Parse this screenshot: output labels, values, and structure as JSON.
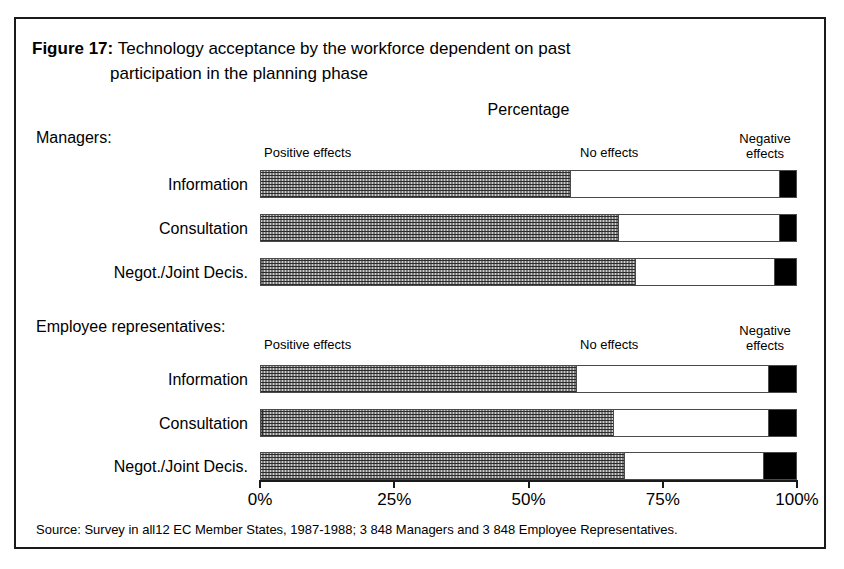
{
  "figure": {
    "number_label": "Figure 17:",
    "title_line_1": "Technology acceptance by the workforce dependent on past",
    "title_line_2": "participation in the planning phase",
    "axis_caption": "Percentage",
    "source": "Source: Survey in all12 EC Member States, 1987-1988; 3 848 Managers and 3 848 Employee Representatives."
  },
  "legend": {
    "positive": "Positive effects",
    "no_effects": "No effects",
    "negative_line_1": "Negative",
    "negative_line_2": "effects"
  },
  "groups": [
    {
      "title": "Managers:"
    },
    {
      "title": "Employee representatives:"
    }
  ],
  "axis": {
    "ticks": [
      "0%",
      "25%",
      "50%",
      "75%",
      "100%"
    ]
  },
  "rows": {
    "managers": [
      {
        "label": "Information"
      },
      {
        "label": "Consultation"
      },
      {
        "label": "Negot./Joint Decis."
      }
    ],
    "employees": [
      {
        "label": "Information"
      },
      {
        "label": "Consultation"
      },
      {
        "label": "Negot./Joint Decis."
      }
    ]
  },
  "colors": {
    "positive": "#cfcfcf",
    "no_effects": "#ffffff",
    "negative": "#000000",
    "frame": "#1a1a1a"
  },
  "chart_data": {
    "type": "bar",
    "orientation": "horizontal",
    "stacked": true,
    "title": "Technology acceptance by the workforce dependent on past participation in the planning phase",
    "xlabel": "Percentage",
    "ylabel": "",
    "xlim": [
      0,
      100
    ],
    "xticks": [
      0,
      25,
      50,
      75,
      100
    ],
    "xtick_labels": [
      "0%",
      "25%",
      "50%",
      "75%",
      "100%"
    ],
    "grid": false,
    "legend_position": "top",
    "series": [
      {
        "name": "Positive effects",
        "color": "#cfcfcf"
      },
      {
        "name": "No effects",
        "color": "#ffffff"
      },
      {
        "name": "Negative effects",
        "color": "#000000"
      }
    ],
    "panels": [
      {
        "group": "Managers:",
        "categories": [
          "Information",
          "Consultation",
          "Negot./Joint Decis."
        ],
        "values": [
          {
            "category": "Information",
            "positive": 58,
            "no_effects": 39,
            "negative": 3
          },
          {
            "category": "Consultation",
            "positive": 67,
            "no_effects": 30,
            "negative": 3
          },
          {
            "category": "Negot./Joint Decis.",
            "positive": 70,
            "no_effects": 26,
            "negative": 4
          }
        ]
      },
      {
        "group": "Employee representatives:",
        "categories": [
          "Information",
          "Consultation",
          "Negot./Joint Decis."
        ],
        "values": [
          {
            "category": "Information",
            "positive": 59,
            "no_effects": 36,
            "negative": 5
          },
          {
            "category": "Consultation",
            "positive": 66,
            "no_effects": 29,
            "negative": 5
          },
          {
            "category": "Negot./Joint Decis.",
            "positive": 68,
            "no_effects": 26,
            "negative": 6
          }
        ]
      }
    ],
    "source": "Source: Survey in all12 EC Member States, 1987-1988; 3 848 Managers and 3 848 Employee Representatives."
  }
}
